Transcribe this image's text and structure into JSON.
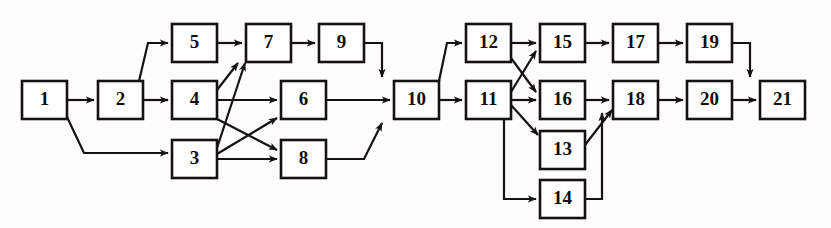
{
  "diagram": {
    "type": "directed-graph",
    "background_color": "#fdfdfc",
    "line_color": "#15120f",
    "node_fill": "#ffffff",
    "node_width": 45,
    "node_height": 38,
    "nodes": [
      {
        "id": "1",
        "label": "1",
        "x": 22,
        "y": 81
      },
      {
        "id": "2",
        "label": "2",
        "x": 98,
        "y": 81
      },
      {
        "id": "3",
        "label": "3",
        "x": 172,
        "y": 140
      },
      {
        "id": "4",
        "label": "4",
        "x": 172,
        "y": 81
      },
      {
        "id": "5",
        "label": "5",
        "x": 172,
        "y": 24
      },
      {
        "id": "6",
        "label": "6",
        "x": 281,
        "y": 81
      },
      {
        "id": "7",
        "label": "7",
        "x": 246,
        "y": 24
      },
      {
        "id": "8",
        "label": "8",
        "x": 281,
        "y": 140
      },
      {
        "id": "9",
        "label": "9",
        "x": 319,
        "y": 24
      },
      {
        "id": "10",
        "label": "10",
        "x": 394,
        "y": 81
      },
      {
        "id": "11",
        "label": "11",
        "x": 466,
        "y": 81
      },
      {
        "id": "12",
        "label": "12",
        "x": 466,
        "y": 24
      },
      {
        "id": "13",
        "label": "13",
        "x": 540,
        "y": 131
      },
      {
        "id": "14",
        "label": "14",
        "x": 540,
        "y": 180
      },
      {
        "id": "15",
        "label": "15",
        "x": 540,
        "y": 24
      },
      {
        "id": "16",
        "label": "16",
        "x": 540,
        "y": 81
      },
      {
        "id": "17",
        "label": "17",
        "x": 613,
        "y": 24
      },
      {
        "id": "18",
        "label": "18",
        "x": 613,
        "y": 81
      },
      {
        "id": "19",
        "label": "19",
        "x": 687,
        "y": 24
      },
      {
        "id": "20",
        "label": "20",
        "x": 687,
        "y": 81
      },
      {
        "id": "21",
        "label": "21",
        "x": 760,
        "y": 81
      }
    ],
    "edges": [
      {
        "from": "1",
        "to": "2",
        "path": "M 67 100 L 94 100",
        "arrow": "right"
      },
      {
        "from": "1",
        "to": "3",
        "path": "M 67 117 L 84 153 L 168 153",
        "arrow": "right"
      },
      {
        "from": "2",
        "to": "4",
        "path": "M 143 100 L 168 100",
        "arrow": "right"
      },
      {
        "from": "2",
        "to": "5",
        "path": "M 139 81 L 148 43 L 168 43",
        "arrow": "right"
      },
      {
        "from": "3",
        "to": "6",
        "path": "M 217 154 L 277 118",
        "arrow": "right"
      },
      {
        "from": "3",
        "to": "7",
        "path": "M 217 148 L 245 63",
        "arrow": "right"
      },
      {
        "from": "3",
        "to": "8",
        "path": "M 217 159 L 277 159",
        "arrow": "right"
      },
      {
        "from": "4",
        "to": "6",
        "path": "M 217 100 L 277 100",
        "arrow": "right"
      },
      {
        "from": "4",
        "to": "7",
        "path": "M 217 90 L 238 63",
        "arrow": "right"
      },
      {
        "from": "4",
        "to": "8",
        "path": "M 217 119 L 277 150",
        "arrow": "right"
      },
      {
        "from": "5",
        "to": "7",
        "path": "M 217 43 L 242 43",
        "arrow": "right"
      },
      {
        "from": "6",
        "to": "10",
        "path": "M 326 100 L 390 100",
        "arrow": "right"
      },
      {
        "from": "7",
        "to": "9",
        "path": "M 291 43 L 315 43",
        "arrow": "right"
      },
      {
        "from": "8",
        "to": "10",
        "path": "M 326 159 L 364 159 L 382 123",
        "arrow": "right"
      },
      {
        "from": "9",
        "to": "10",
        "path": "M 364 43 L 382 43 L 382 77",
        "arrow": "down"
      },
      {
        "from": "10",
        "to": "11",
        "path": "M 439 100 L 462 100",
        "arrow": "right"
      },
      {
        "from": "10",
        "to": "12",
        "path": "M 439 81 L 447 43 L 462 43",
        "arrow": "right"
      },
      {
        "from": "11",
        "to": "13",
        "path": "M 511 105 L 538 135",
        "arrow": "right"
      },
      {
        "from": "11",
        "to": "14",
        "path": "M 504 119 L 504 199 L 536 199",
        "arrow": "right"
      },
      {
        "from": "11",
        "to": "15",
        "path": "M 511 92 L 536 51",
        "arrow": "right"
      },
      {
        "from": "11",
        "to": "16",
        "path": "M 511 100 L 536 100",
        "arrow": "right"
      },
      {
        "from": "12",
        "to": "15",
        "path": "M 511 43 L 536 43",
        "arrow": "right"
      },
      {
        "from": "12",
        "to": "16",
        "path": "M 511 58 L 536 92",
        "arrow": "right"
      },
      {
        "from": "13",
        "to": "18",
        "path": "M 585 145 L 612 110",
        "arrow": "right"
      },
      {
        "from": "14",
        "to": "18",
        "path": "M 585 199 L 602 199 L 602 113",
        "arrow": "up"
      },
      {
        "from": "15",
        "to": "17",
        "path": "M 585 43 L 609 43",
        "arrow": "right"
      },
      {
        "from": "16",
        "to": "18",
        "path": "M 585 100 L 609 100",
        "arrow": "right"
      },
      {
        "from": "17",
        "to": "19",
        "path": "M 658 43 L 683 43",
        "arrow": "right"
      },
      {
        "from": "18",
        "to": "20",
        "path": "M 658 100 L 683 100",
        "arrow": "right"
      },
      {
        "from": "19",
        "to": "21",
        "path": "M 732 43 L 750 43 L 750 77",
        "arrow": "down"
      },
      {
        "from": "20",
        "to": "21",
        "path": "M 732 100 L 756 100",
        "arrow": "right"
      }
    ]
  }
}
